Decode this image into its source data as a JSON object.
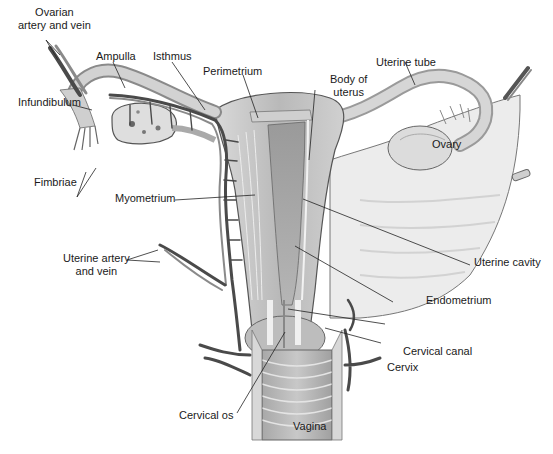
{
  "diagram": {
    "type": "anatomical-illustration",
    "colors": {
      "tissue_light": "#e6e6e6",
      "tissue_mid": "#c4c4c4",
      "tissue_dark": "#8e8e8e",
      "vessel": "#4a4a4a",
      "outline": "#555555",
      "label_text": "#1a1a1a",
      "leader_line": "#222222"
    },
    "labels": {
      "ovarian_artery_vein": "Ovarian\nartery and vein",
      "ovarian_artery_vein_l1": "Ovarian",
      "ovarian_artery_vein_l2": "artery and vein",
      "ampulla": "Ampulla",
      "isthmus": "Isthmus",
      "perimetrium": "Perimetrium",
      "body_of_uterus_l1": "Body of",
      "body_of_uterus_l2": "uterus",
      "uterine_tube": "Uterine tube",
      "infundibulum": "Infundibulum",
      "ovary": "Ovary",
      "fimbriae": "Fimbriae",
      "myometrium": "Myometrium",
      "uterine_artery_vein_l1": "Uterine artery",
      "uterine_artery_vein_l2": "and vein",
      "uterine_cavity": "Uterine cavity",
      "endometrium": "Endometrium",
      "cervical_canal": "Cervical canal",
      "cervix": "Cervix",
      "cervical_os": "Cervical os",
      "vagina": "Vagina"
    }
  }
}
